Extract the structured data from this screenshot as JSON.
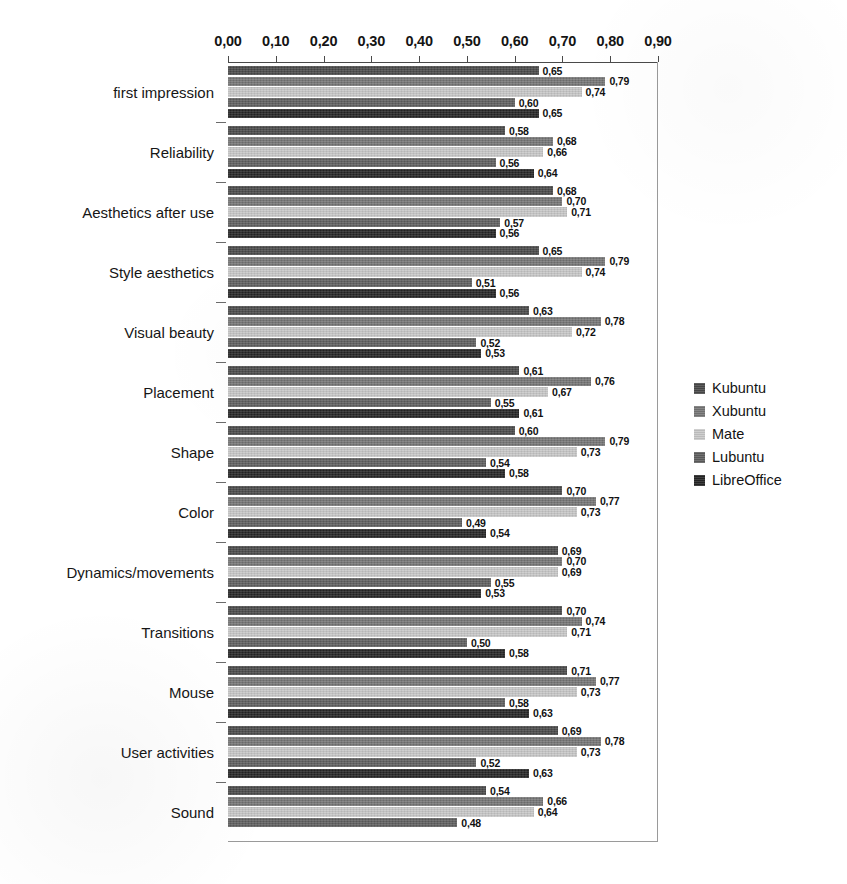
{
  "chart_data": {
    "type": "bar",
    "orientation": "horizontal",
    "title": "",
    "xlabel": "",
    "ylabel": "",
    "xlim": [
      0.0,
      0.9
    ],
    "grid": false,
    "legend_position": "right",
    "decimal_separator": ",",
    "x_ticks": [
      "0,00",
      "0,10",
      "0,20",
      "0,30",
      "0,40",
      "0,50",
      "0,60",
      "0,70",
      "0,80",
      "0,90"
    ],
    "x_tick_values": [
      0.0,
      0.1,
      0.2,
      0.3,
      0.4,
      0.5,
      0.6,
      0.7,
      0.8,
      0.9
    ],
    "categories": [
      "first impression",
      "Reliability",
      "Aesthetics after use",
      "Style aesthetics",
      "Visual beauty",
      "Placement",
      "Shape",
      "Color",
      "Dynamics/movements",
      "Transitions",
      "Mouse",
      "User activities",
      "Sound"
    ],
    "series": [
      {
        "name": "Kubuntu",
        "color": "#4a4a4a",
        "values": [
          0.65,
          0.58,
          0.68,
          0.65,
          0.63,
          0.61,
          0.6,
          0.7,
          0.69,
          0.7,
          0.71,
          0.69,
          0.54
        ],
        "labels": [
          "0,65",
          "0,58",
          "0,68",
          "0,65",
          "0,63",
          "0,61",
          "0,60",
          "0,70",
          "0,69",
          "0,70",
          "0,71",
          "0,69",
          "0,54"
        ]
      },
      {
        "name": "Xubuntu",
        "color": "#767676",
        "values": [
          0.79,
          0.68,
          0.7,
          0.79,
          0.78,
          0.76,
          0.79,
          0.77,
          0.7,
          0.74,
          0.77,
          0.78,
          0.66
        ],
        "labels": [
          "0,79",
          "0,68",
          "0,70",
          "0,79",
          "0,78",
          "0,76",
          "0,79",
          "0,77",
          "0,70",
          "0,74",
          "0,77",
          "0,78",
          "0,66"
        ]
      },
      {
        "name": "Mate",
        "color": "#c8c8c8",
        "values": [
          0.74,
          0.66,
          0.71,
          0.74,
          0.72,
          0.67,
          0.73,
          0.73,
          0.69,
          0.71,
          0.73,
          0.73,
          0.64
        ],
        "labels": [
          "0,74",
          "0,66",
          "0,71",
          "0,74",
          "0,72",
          "0,67",
          "0,73",
          "0,73",
          "0,69",
          "0,71",
          "0,73",
          "0,73",
          "0,64"
        ]
      },
      {
        "name": "Lubuntu",
        "color": "#5f5f5f",
        "values": [
          0.6,
          0.56,
          0.57,
          0.51,
          0.52,
          0.55,
          0.54,
          0.49,
          0.55,
          0.5,
          0.58,
          0.52,
          0.48
        ],
        "labels": [
          "0,60",
          "0,56",
          "0,57",
          "0,51",
          "0,52",
          "0,55",
          "0,54",
          "0,49",
          "0,55",
          "0,50",
          "0,58",
          "0,52",
          "0,48"
        ]
      },
      {
        "name": "LibreOffice",
        "color": "#262626",
        "values": [
          0.65,
          0.64,
          0.56,
          0.56,
          0.53,
          0.61,
          0.58,
          0.54,
          0.53,
          0.58,
          0.63,
          0.63,
          null
        ],
        "labels": [
          "0,65",
          "0,64",
          "0,56",
          "0,56",
          "0,53",
          "0,61",
          "0,58",
          "0,54",
          "0,53",
          "0,58",
          "0,63",
          "0,63",
          null
        ]
      }
    ]
  },
  "legend": {
    "items": [
      {
        "label": "Kubuntu",
        "color": "#4a4a4a"
      },
      {
        "label": "Xubuntu",
        "color": "#767676"
      },
      {
        "label": "Mate",
        "color": "#c8c8c8"
      },
      {
        "label": "Lubuntu",
        "color": "#5f5f5f"
      },
      {
        "label": "LibreOffice",
        "color": "#262626"
      }
    ]
  }
}
